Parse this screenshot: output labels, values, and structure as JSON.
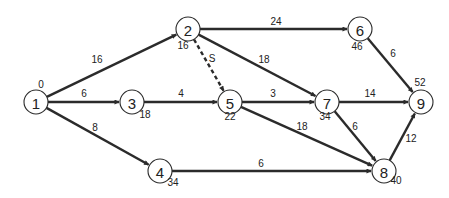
{
  "diagram": {
    "type": "activity-network",
    "nodes": [
      {
        "id": "1",
        "label": "1",
        "x": 36,
        "y": 102,
        "time": "0",
        "time_x": 41,
        "time_y": 88
      },
      {
        "id": "2",
        "label": "2",
        "x": 188,
        "y": 29,
        "time": "16",
        "time_x": 183,
        "time_y": 49
      },
      {
        "id": "3",
        "label": "3",
        "x": 132,
        "y": 102,
        "time": "18",
        "time_x": 145,
        "time_y": 118
      },
      {
        "id": "4",
        "label": "4",
        "x": 160,
        "y": 171,
        "time": "34",
        "time_x": 173,
        "time_y": 186
      },
      {
        "id": "5",
        "label": "5",
        "x": 230,
        "y": 102,
        "time": "22",
        "time_x": 230,
        "time_y": 120
      },
      {
        "id": "6",
        "label": "6",
        "x": 360,
        "y": 29,
        "time": "46",
        "time_x": 357,
        "time_y": 50
      },
      {
        "id": "7",
        "label": "7",
        "x": 327,
        "y": 102,
        "time": "34",
        "time_x": 325,
        "time_y": 120
      },
      {
        "id": "8",
        "label": "8",
        "x": 384,
        "y": 171,
        "time": "40",
        "time_x": 396,
        "time_y": 184
      },
      {
        "id": "9",
        "label": "9",
        "x": 421,
        "y": 102,
        "time": "52",
        "time_x": 420,
        "time_y": 86
      }
    ],
    "edges": [
      {
        "from": "1",
        "to": "2",
        "weight": "16",
        "label_x": 97,
        "label_y": 63,
        "dashed": false
      },
      {
        "from": "1",
        "to": "3",
        "weight": "6",
        "label_x": 84,
        "label_y": 97,
        "dashed": false
      },
      {
        "from": "1",
        "to": "4",
        "weight": "8",
        "label_x": 95,
        "label_y": 131,
        "dashed": false
      },
      {
        "from": "2",
        "to": "6",
        "weight": "24",
        "label_x": 276,
        "label_y": 25,
        "dashed": false
      },
      {
        "from": "2",
        "to": "5",
        "weight": "S",
        "label_x": 212,
        "label_y": 62,
        "dashed": true
      },
      {
        "from": "2",
        "to": "7",
        "weight": "18",
        "label_x": 264,
        "label_y": 63,
        "dashed": false
      },
      {
        "from": "3",
        "to": "5",
        "weight": "4",
        "label_x": 181,
        "label_y": 97,
        "dashed": false
      },
      {
        "from": "5",
        "to": "7",
        "weight": "3",
        "label_x": 273,
        "label_y": 97,
        "dashed": false
      },
      {
        "from": "5",
        "to": "8",
        "weight": "18",
        "label_x": 302,
        "label_y": 130,
        "dashed": false
      },
      {
        "from": "4",
        "to": "8",
        "weight": "6",
        "label_x": 261,
        "label_y": 167,
        "dashed": false
      },
      {
        "from": "6",
        "to": "9",
        "weight": "6",
        "label_x": 393,
        "label_y": 57,
        "dashed": false
      },
      {
        "from": "7",
        "to": "9",
        "weight": "14",
        "label_x": 370,
        "label_y": 97,
        "dashed": false
      },
      {
        "from": "7",
        "to": "8",
        "weight": "6",
        "label_x": 355,
        "label_y": 130,
        "dashed": false
      },
      {
        "from": "8",
        "to": "9",
        "weight": "12",
        "label_x": 411,
        "label_y": 142,
        "dashed": false
      }
    ],
    "colors": {
      "stroke": "#2b2b2b",
      "background": "#ffffff"
    }
  }
}
